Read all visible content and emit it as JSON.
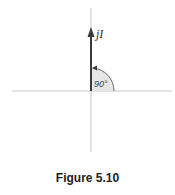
{
  "figure": {
    "caption": "Figure 5.10",
    "phasor_label": "jI",
    "angle_label": "90°",
    "colors": {
      "axis": "#c8c8c8",
      "phasor": "#3a3a3a",
      "arc_fill": "#e6e6e6",
      "arc_stroke": "#6a6a6a"
    }
  }
}
